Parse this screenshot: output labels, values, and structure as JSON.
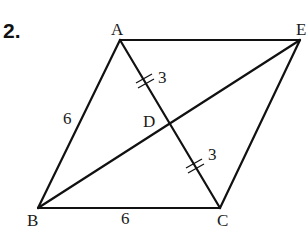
{
  "problem": {
    "number": "2."
  },
  "diagram": {
    "vertices": {
      "A": {
        "label": "A",
        "x": 120,
        "y": 40
      },
      "E": {
        "label": "E",
        "x": 300,
        "y": 40
      },
      "B": {
        "label": "B",
        "x": 38,
        "y": 208
      },
      "C": {
        "label": "C",
        "x": 220,
        "y": 208
      },
      "D": {
        "label": "D",
        "x": 170,
        "y": 124
      }
    },
    "segments": [
      {
        "from": "A",
        "to": "E"
      },
      {
        "from": "A",
        "to": "B"
      },
      {
        "from": "B",
        "to": "C"
      },
      {
        "from": "C",
        "to": "E"
      },
      {
        "from": "A",
        "to": "C"
      },
      {
        "from": "B",
        "to": "E"
      }
    ],
    "measures": {
      "AB": "6",
      "BC": "6",
      "AD": "3",
      "DC": "3"
    },
    "congruence_marks": {
      "AD": "double-tick",
      "DC": "double-tick"
    }
  }
}
